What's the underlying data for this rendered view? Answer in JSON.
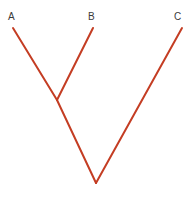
{
  "figure": {
    "kind": "cladogram",
    "width": 195,
    "height": 199,
    "background_color": "#ffffff",
    "branch_color": "#c43d23",
    "branch_width": 2,
    "label_color": "#3a3a3a",
    "label_font_size": 10
  },
  "chart_data": {
    "type": "diagram",
    "subtype": "cladogram",
    "xlabel": "",
    "ylabel": "",
    "grid": false,
    "legend": null,
    "orientation": "tips-up",
    "newick": "((A,B),C);",
    "taxa": [
      "A",
      "B",
      "C"
    ],
    "nodes": [
      {
        "id": "tip-a",
        "label": "A",
        "type": "tip",
        "x": 13,
        "y": 28
      },
      {
        "id": "tip-b",
        "label": "B",
        "type": "tip",
        "x": 93,
        "y": 28
      },
      {
        "id": "tip-c",
        "label": "C",
        "type": "tip",
        "x": 182,
        "y": 28
      },
      {
        "id": "node-ab",
        "label": "",
        "type": "internal",
        "x": 57,
        "y": 100
      },
      {
        "id": "node-root",
        "label": "",
        "type": "root",
        "x": 96,
        "y": 183
      }
    ],
    "branches": [
      {
        "id": "branch-a",
        "from": "tip-a",
        "to": "node-ab",
        "x1": 13,
        "y1": 28,
        "x2": 57,
        "y2": 100
      },
      {
        "id": "branch-b",
        "from": "tip-b",
        "to": "node-ab",
        "x1": 93,
        "y1": 28,
        "x2": 57,
        "y2": 100
      },
      {
        "id": "branch-ab",
        "from": "node-ab",
        "to": "node-root",
        "x1": 57,
        "y1": 100,
        "x2": 96,
        "y2": 183
      },
      {
        "id": "branch-c",
        "from": "tip-c",
        "to": "node-root",
        "x1": 182,
        "y1": 28,
        "x2": 96,
        "y2": 183
      }
    ],
    "labels": [
      {
        "id": "label-a",
        "text": "A",
        "x": 8,
        "y": 12
      },
      {
        "id": "label-b",
        "text": "B",
        "x": 88,
        "y": 12
      },
      {
        "id": "label-c",
        "text": "C",
        "x": 174,
        "y": 12
      }
    ]
  }
}
